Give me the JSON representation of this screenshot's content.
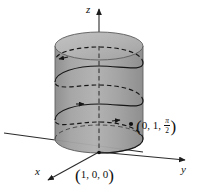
{
  "figure": {
    "type": "3d-vector-diagram",
    "background_color": "#ffffff",
    "axes": [
      {
        "name": "x",
        "label": "x",
        "direction": "down-left"
      },
      {
        "name": "y",
        "label": "y",
        "direction": "right"
      },
      {
        "name": "z",
        "label": "z",
        "direction": "up"
      }
    ],
    "points": [
      {
        "name": "point-1-0-0",
        "label": "(1, 0, 0)",
        "open_paren": "(",
        "coord_x": "1",
        "sep1": ", ",
        "coord_y": "0",
        "sep2": ", ",
        "coord_z": "0",
        "close_paren": ")"
      },
      {
        "name": "point-0-1-pi-over-2",
        "open_paren": "(",
        "coord_x": "0",
        "sep1": ", ",
        "coord_y": "1",
        "sep2": ", ",
        "frac_num": "π",
        "frac_den": "2",
        "close_paren": ")"
      }
    ],
    "colors": {
      "cylinder_body": "#9a9a9a",
      "cylinder_top": "#b5b5b5",
      "cylinder_shadow": "#7e7e7e",
      "outline": "#4a4a4a",
      "curve": "#1a1a1a",
      "axis": "#2b2b2b"
    }
  }
}
